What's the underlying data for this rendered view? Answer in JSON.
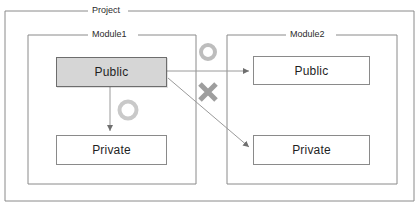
{
  "diagram": {
    "colors": {
      "outline": "#8a8a8a",
      "outline_dark": "#6d6d6d",
      "fill_public_module1": "#d6d6d6",
      "fill_default": "#ffffff",
      "text": "#1f1f1f",
      "marker_gray": "#a8a8a8",
      "arrow": "#7a7a7a",
      "background": "#ffffff"
    },
    "groups": [
      {
        "id": "project",
        "label": "Project",
        "x": 5,
        "y": 11,
        "width": 409,
        "height": 190
      },
      {
        "id": "module1",
        "label": "Module1",
        "x": 28,
        "y": 35,
        "width": 168,
        "height": 149
      },
      {
        "id": "module2",
        "label": "Module2",
        "x": 227,
        "y": 35,
        "width": 170,
        "height": 149
      }
    ],
    "nodes": [
      {
        "id": "module1-public",
        "label": "Public",
        "group": "module1",
        "visibility": "public",
        "highlighted": true,
        "x": 56,
        "y": 57,
        "width": 111,
        "height": 30
      },
      {
        "id": "module1-private",
        "label": "Private",
        "group": "module1",
        "visibility": "private",
        "highlighted": false,
        "x": 56,
        "y": 135,
        "width": 111,
        "height": 30
      },
      {
        "id": "module2-public",
        "label": "Public",
        "group": "module2",
        "visibility": "public",
        "highlighted": false,
        "x": 253,
        "y": 56,
        "width": 117,
        "height": 29
      },
      {
        "id": "module2-private",
        "label": "Private",
        "group": "module2",
        "visibility": "private",
        "highlighted": false,
        "x": 253,
        "y": 135,
        "width": 117,
        "height": 30
      }
    ],
    "edges": [
      {
        "id": "edge-public-to-private-internal",
        "from": "module1-public",
        "to": "module1-private",
        "status": "allowed",
        "marker": "circle"
      },
      {
        "id": "edge-public-to-module2-public",
        "from": "module1-public",
        "to": "module2-public",
        "status": "allowed",
        "marker": "circle"
      },
      {
        "id": "edge-public-to-module2-private",
        "from": "module1-public",
        "to": "module2-private",
        "status": "denied",
        "marker": "cross"
      }
    ],
    "markers": [
      {
        "id": "marker-allowed-internal",
        "glyph": "circle",
        "meaning": "allowed",
        "cx": 128,
        "cy": 110,
        "r": 8.5
      },
      {
        "id": "marker-allowed-cross-module",
        "glyph": "circle",
        "meaning": "allowed",
        "cx": 208,
        "cy": 52,
        "r": 7.5
      },
      {
        "id": "marker-denied-cross-module",
        "glyph": "cross",
        "meaning": "denied",
        "cx": 208,
        "cy": 92,
        "size": 9
      }
    ]
  }
}
